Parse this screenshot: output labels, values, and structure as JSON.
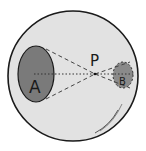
{
  "diagram": {
    "labels": {
      "a": "A",
      "b": "B",
      "p": "P"
    },
    "colors": {
      "background": "#ffffff",
      "sphere_fill": "#e2e2e2",
      "sphere_stroke": "#1a1a1a",
      "region_fill": "#7a7a7a",
      "line_color": "#444444"
    }
  }
}
